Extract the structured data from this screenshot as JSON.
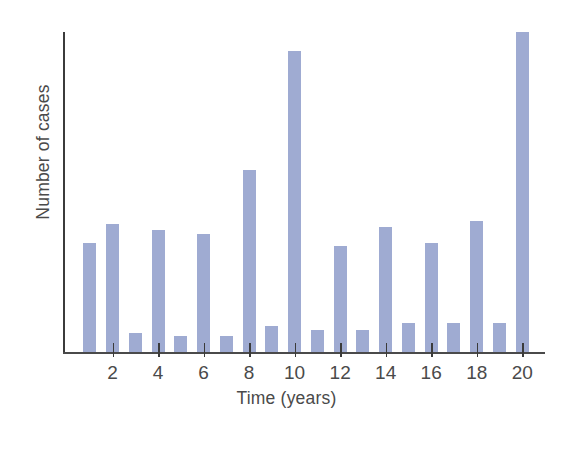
{
  "chart_data": {
    "type": "bar",
    "title": "",
    "subtitle": "",
    "xlabel": "Time (years)",
    "ylabel": "Number of cases",
    "x": [
      1,
      2,
      3,
      4,
      5,
      6,
      7,
      8,
      9,
      10,
      11,
      12,
      13,
      14,
      15,
      16,
      17,
      18,
      19,
      20
    ],
    "categories": [
      "1",
      "2",
      "3",
      "4",
      "5",
      "6",
      "7",
      "8",
      "9",
      "10",
      "11",
      "12",
      "13",
      "14",
      "15",
      "16",
      "17",
      "18",
      "19",
      "20"
    ],
    "values": [
      34,
      40,
      6,
      38,
      5,
      37,
      5,
      57,
      8,
      94,
      7,
      33,
      7,
      39,
      9,
      34,
      9,
      41,
      9,
      100
    ],
    "tick_labels": [
      "2",
      "4",
      "6",
      "8",
      "10",
      "12",
      "14",
      "16",
      "18",
      "20"
    ],
    "tick_values": [
      2,
      4,
      6,
      8,
      10,
      12,
      14,
      16,
      18,
      20
    ],
    "xlim": [
      0,
      21
    ],
    "ylim": [
      0,
      100
    ],
    "grid": false,
    "legend": null,
    "bar_color": "#9fabd2",
    "axis_color": "#3b3b3b",
    "text_color": "#4a4a4a",
    "background": "#ffffff",
    "y_axis_ticks_shown": false,
    "annotations": []
  }
}
